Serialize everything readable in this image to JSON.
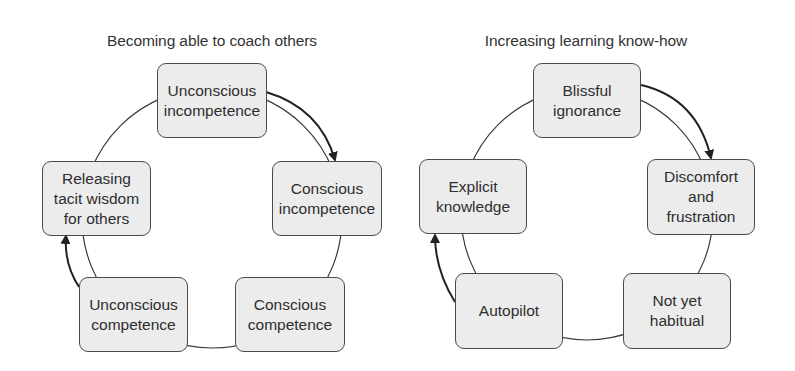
{
  "diagrams": [
    {
      "title": "Becoming able to coach others",
      "stages": [
        {
          "label": "Unconscious\nincompetence"
        },
        {
          "label": "Conscious\nincompetence"
        },
        {
          "label": "Conscious\ncompetence"
        },
        {
          "label": "Unconscious\ncompetence"
        },
        {
          "label": "Releasing\ntacit wisdom\nfor others"
        }
      ],
      "arrows": [
        {
          "from": "Unconscious incompetence",
          "to": "Conscious incompetence"
        },
        {
          "from": "Unconscious competence",
          "to": "Releasing tacit wisdom for others"
        }
      ]
    },
    {
      "title": "Increasing learning know-how",
      "stages": [
        {
          "label": "Blissful\nignorance"
        },
        {
          "label": "Discomfort\nand\nfrustration"
        },
        {
          "label": "Not yet\nhabitual"
        },
        {
          "label": "Autopilot"
        },
        {
          "label": "Explicit\nknowledge"
        }
      ],
      "arrows": [
        {
          "from": "Blissful ignorance",
          "to": "Discomfort and frustration"
        },
        {
          "from": "Autopilot",
          "to": "Explicit knowledge"
        }
      ]
    }
  ],
  "colors": {
    "box_fill": "#ececec",
    "box_border": "#4a4a4a",
    "line": "#333333",
    "text": "#2e2e2e"
  }
}
